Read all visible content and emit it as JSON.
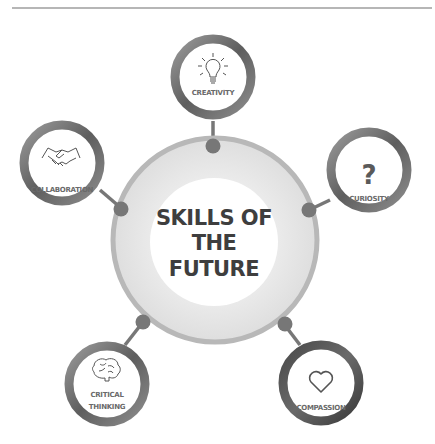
{
  "title": {
    "lines": [
      "SKILLS OF",
      "THE",
      "FUTURE"
    ]
  },
  "skills": [
    {
      "id": "creativity",
      "label_lines": [
        "CREATIVITY"
      ],
      "icon": "lightbulb-icon"
    },
    {
      "id": "collaboration",
      "label_lines": [
        "COLLABORATION"
      ],
      "icon": "handshake-icon"
    },
    {
      "id": "curiosity",
      "label_lines": [
        "CURIOSITY"
      ],
      "icon": "question-mark-icon",
      "icon_glyph": "?"
    },
    {
      "id": "critical-thinking",
      "label_lines": [
        "CRITICAL",
        "THINKING"
      ],
      "icon": "brain-icon"
    },
    {
      "id": "compassion",
      "label_lines": [
        "COMPASSION"
      ],
      "icon": "heart-icon"
    }
  ],
  "colors": {
    "ring_dark": "#5a5a5a",
    "ring_mid": "#8a8a8a",
    "center_ring": "#b5b5b5",
    "center_fill": "#e9e9e9",
    "connector": "#777777",
    "divider": "#6e6e6e"
  }
}
